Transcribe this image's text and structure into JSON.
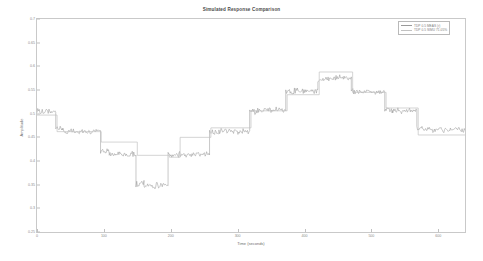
{
  "chart_data": {
    "type": "line",
    "title": "Simulated Response Comparison",
    "xlabel": "Time (seconds)",
    "ylabel": "Amplitude",
    "xlim": [
      0,
      640
    ],
    "ylim": [
      0.25,
      0.7
    ],
    "grid": false,
    "legend_position": "top-right",
    "xticks": [
      0,
      100,
      200,
      300,
      400,
      500,
      600
    ],
    "xtick_labels": [
      "0",
      "100",
      "200",
      "300",
      "400",
      "500",
      "600"
    ],
    "yticks": [
      0.25,
      0.3,
      0.35,
      0.4,
      0.45,
      0.5,
      0.55,
      0.6,
      0.65,
      0.7
    ],
    "ytick_labels": [
      "0.25",
      "0.3",
      "0.35",
      "0.4",
      "0.45",
      "0.5",
      "0.55",
      "0.6",
      "0.65",
      "0.7"
    ],
    "series": [
      {
        "name": "TDP 0.5 MEAS (r)",
        "color": "#9a9a9a",
        "style": "noisy-step",
        "steps": [
          {
            "x0": 0,
            "x1": 28,
            "y": 0.505
          },
          {
            "x0": 28,
            "x1": 38,
            "y": 0.47
          },
          {
            "x0": 38,
            "x1": 95,
            "y": 0.462
          },
          {
            "x0": 95,
            "x1": 108,
            "y": 0.42
          },
          {
            "x0": 108,
            "x1": 148,
            "y": 0.414
          },
          {
            "x0": 148,
            "x1": 160,
            "y": 0.352
          },
          {
            "x0": 160,
            "x1": 196,
            "y": 0.348
          },
          {
            "x0": 196,
            "x1": 212,
            "y": 0.412
          },
          {
            "x0": 212,
            "x1": 258,
            "y": 0.414
          },
          {
            "x0": 258,
            "x1": 272,
            "y": 0.462
          },
          {
            "x0": 272,
            "x1": 318,
            "y": 0.463
          },
          {
            "x0": 318,
            "x1": 330,
            "y": 0.505
          },
          {
            "x0": 330,
            "x1": 372,
            "y": 0.508
          },
          {
            "x0": 372,
            "x1": 385,
            "y": 0.547
          },
          {
            "x0": 385,
            "x1": 420,
            "y": 0.549
          },
          {
            "x0": 420,
            "x1": 432,
            "y": 0.572
          },
          {
            "x0": 432,
            "x1": 470,
            "y": 0.575
          },
          {
            "x0": 470,
            "x1": 482,
            "y": 0.548
          },
          {
            "x0": 482,
            "x1": 520,
            "y": 0.546
          },
          {
            "x0": 520,
            "x1": 532,
            "y": 0.508
          },
          {
            "x0": 532,
            "x1": 568,
            "y": 0.506
          },
          {
            "x0": 568,
            "x1": 580,
            "y": 0.468
          },
          {
            "x0": 580,
            "x1": 640,
            "y": 0.466
          }
        ]
      },
      {
        "name": "TDP 0.5 SIMU 71.05%",
        "color": "#c2c2c2",
        "style": "step",
        "steps": [
          {
            "x0": 0,
            "x1": 30,
            "y": 0.497
          },
          {
            "x0": 30,
            "x1": 96,
            "y": 0.462
          },
          {
            "x0": 96,
            "x1": 150,
            "y": 0.44
          },
          {
            "x0": 150,
            "x1": 198,
            "y": 0.412
          },
          {
            "x0": 198,
            "x1": 214,
            "y": 0.408
          },
          {
            "x0": 214,
            "x1": 260,
            "y": 0.45
          },
          {
            "x0": 260,
            "x1": 320,
            "y": 0.47
          },
          {
            "x0": 320,
            "x1": 374,
            "y": 0.506
          },
          {
            "x0": 374,
            "x1": 422,
            "y": 0.54
          },
          {
            "x0": 422,
            "x1": 472,
            "y": 0.588
          },
          {
            "x0": 472,
            "x1": 522,
            "y": 0.545
          },
          {
            "x0": 522,
            "x1": 570,
            "y": 0.512
          },
          {
            "x0": 570,
            "x1": 640,
            "y": 0.455
          }
        ]
      }
    ]
  },
  "legend": {
    "entries": [
      {
        "label": "TDP 0.5 MEAS (r)"
      },
      {
        "label": "TDP 0.5 SIMU 71.05%"
      }
    ]
  }
}
